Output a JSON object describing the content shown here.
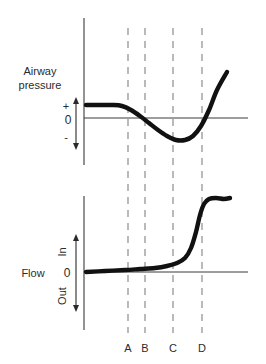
{
  "figure": {
    "title": "",
    "background_color": "#ffffff",
    "trace_color": "#111111",
    "dashed_line_color": "#8c8c8c",
    "axis_color": "#3a3a3a"
  },
  "panels": {
    "pressure": {
      "axis_label_line1": "Airway",
      "axis_label_line2": "pressure",
      "positive_label": "+",
      "zero_label": "0",
      "negative_label": "-"
    },
    "flow": {
      "axis_label": "Flow",
      "up_label": "In",
      "zero_label": "0",
      "down_label": "Out"
    }
  },
  "markers": [
    {
      "label": "A",
      "x": 128
    },
    {
      "label": "B",
      "x": 145
    },
    {
      "label": "C",
      "x": 173
    },
    {
      "label": "D",
      "x": 202
    }
  ],
  "chart_data": {
    "type": "line",
    "title": "",
    "xlabel": "",
    "ylabel": "",
    "grid": false,
    "legend": false,
    "annotations": [
      "A",
      "B",
      "C",
      "D"
    ],
    "panels": [
      {
        "name": "Airway pressure",
        "ylabel": "Airway pressure",
        "ytick_labels": [
          "+",
          "0",
          "-"
        ],
        "xlim": [
          84,
          248
        ],
        "ylim_px": [
          60,
          165
        ],
        "zero_px": 118,
        "series": [
          {
            "name": "Airway pressure",
            "description": "Positive plateau, falls below zero to a negative trough near marker C, then rises steeply crossing zero at marker D",
            "points": [
              [
                86,
                105
              ],
              [
                100,
                105
              ],
              [
                112,
                105
              ],
              [
                122,
                106
              ],
              [
                131,
                110
              ],
              [
                140,
                116
              ],
              [
                149,
                123
              ],
              [
                158,
                130
              ],
              [
                167,
                136
              ],
              [
                176,
                140
              ],
              [
                185,
                140
              ],
              [
                193,
                136
              ],
              [
                201,
                126
              ],
              [
                209,
                110
              ],
              [
                217,
                90
              ],
              [
                227,
                72
              ]
            ]
          }
        ]
      },
      {
        "name": "Flow",
        "ylabel": "Flow",
        "ytick_labels": [
          "In",
          "0",
          "Out"
        ],
        "xlim": [
          84,
          248
        ],
        "ylim_px": [
          196,
          330
        ],
        "zero_px": 272,
        "series": [
          {
            "name": "Flow",
            "description": "Zero flow plateau with slight inspiratory drift, then a sharp rise to a high inspiratory plateau just after marker D",
            "points": [
              [
                86,
                272
              ],
              [
                105,
                271
              ],
              [
                125,
                270
              ],
              [
                140,
                269
              ],
              [
                155,
                268
              ],
              [
                167,
                266
              ],
              [
                177,
                263
              ],
              [
                185,
                258
              ],
              [
                191,
                248
              ],
              [
                196,
                232
              ],
              [
                200,
                215
              ],
              [
                204,
                204
              ],
              [
                209,
                199
              ],
              [
                216,
                198
              ],
              [
                224,
                199
              ],
              [
                230,
                198
              ]
            ]
          }
        ]
      }
    ]
  }
}
